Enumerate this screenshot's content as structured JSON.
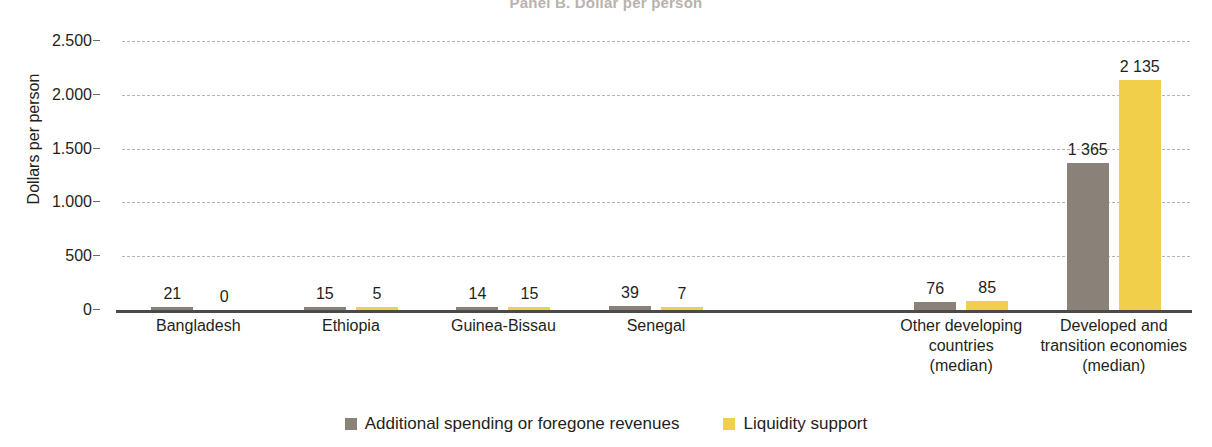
{
  "chart_data": {
    "type": "bar",
    "title": "Panel B. Dollar per person",
    "xlabel": "",
    "ylabel": "Dollars per person",
    "ylim": [
      0,
      2500
    ],
    "yticks": [
      0,
      500,
      1000,
      1500,
      2000,
      2500
    ],
    "ytick_labels": [
      "0",
      "500",
      "1.000",
      "1.500",
      "2.000",
      "2.500"
    ],
    "grid": true,
    "legend_position": "bottom",
    "categories": [
      "Bangladesh",
      "Ethiopia",
      "Guinea-Bissau",
      "Senegal",
      "",
      "Other developing countries (median)",
      "Developed and transition economies (median)"
    ],
    "category_lines": [
      [
        "Bangladesh"
      ],
      [
        "Ethiopia"
      ],
      [
        "Guinea-Bissau"
      ],
      [
        "Senegal"
      ],
      [
        ""
      ],
      [
        "Other developing",
        "countries",
        "(median)"
      ],
      [
        "Developed and",
        "transition economies",
        "(median)"
      ]
    ],
    "series": [
      {
        "name": "Additional spending or foregone revenues",
        "color": "#8a8178",
        "values": [
          21,
          15,
          14,
          39,
          null,
          76,
          1365
        ],
        "labels": [
          "21",
          "15",
          "14",
          "39",
          "",
          "76",
          "1 365"
        ]
      },
      {
        "name": "Liquidity support",
        "color": "#f2cf4a",
        "values": [
          0,
          5,
          15,
          7,
          null,
          85,
          2135
        ],
        "labels": [
          "0",
          "5",
          "15",
          "7",
          "",
          "85",
          "2 135"
        ]
      }
    ]
  },
  "legend": {
    "items": [
      {
        "label": "Additional spending or foregone revenues",
        "swatch": "spending"
      },
      {
        "label": "Liquidity support",
        "swatch": "liquidity"
      }
    ]
  }
}
